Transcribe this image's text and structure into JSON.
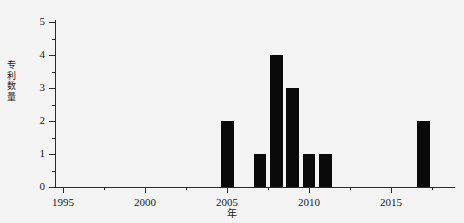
{
  "chart_data": {
    "type": "bar",
    "title": "",
    "subtitle": "",
    "xlabel": "年",
    "ylabel": "专利数量",
    "xlim": [
      1994.5,
      2018.9
    ],
    "ylim": [
      0,
      5
    ],
    "grid": false,
    "legend": null,
    "bar_color": "#0a0a0a",
    "background_color": "#f4f4f4",
    "axis_color": "#2b2b2b",
    "x_ticks": [
      1995,
      2000,
      2005,
      2010,
      2015
    ],
    "x_tick_labels": [
      "1995",
      "2000",
      "2005",
      "2010",
      "2015"
    ],
    "x_minor_ticks": [
      1997.5,
      2002.5,
      2007.5,
      2012.5,
      2017.5
    ],
    "y_ticks": [
      0,
      1,
      2,
      3,
      4,
      5
    ],
    "y_tick_labels": [
      "0",
      "1",
      "2",
      "3",
      "4",
      "5"
    ],
    "y_minor_ticks": [
      0.5,
      1.5,
      2.5,
      3.5,
      4.5
    ],
    "categories": [
      2005,
      2007,
      2008,
      2009,
      2010,
      2011,
      2017
    ],
    "values": [
      2,
      1,
      4,
      3,
      1,
      1,
      2
    ],
    "bar_width_years": 0.78,
    "bars": [
      {
        "x": 2005,
        "value": 2
      },
      {
        "x": 2007,
        "value": 1
      },
      {
        "x": 2008,
        "value": 4
      },
      {
        "x": 2009,
        "value": 3
      },
      {
        "x": 2010,
        "value": 1
      },
      {
        "x": 2011,
        "value": 1
      },
      {
        "x": 2017,
        "value": 2
      }
    ]
  }
}
